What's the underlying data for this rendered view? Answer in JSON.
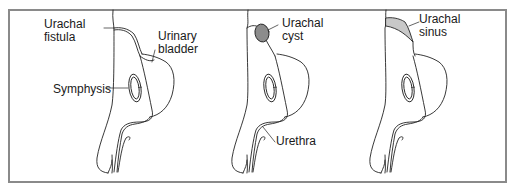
{
  "figure": {
    "panels": [
      {
        "id": "fistula",
        "labels": [
          {
            "text": "Urachal\nfistula",
            "target": "urachal-fistula"
          },
          {
            "text": "Urinary\nbladder",
            "target": "urinary-bladder"
          },
          {
            "text": "Symphysis",
            "target": "symphysis"
          }
        ]
      },
      {
        "id": "cyst",
        "labels": [
          {
            "text": "Urachal\ncyst",
            "target": "urachal-cyst"
          },
          {
            "text": "Urethra",
            "target": "urethra"
          }
        ]
      },
      {
        "id": "sinus",
        "labels": [
          {
            "text": "Urachal\nsinus",
            "target": "urachal-sinus"
          }
        ]
      }
    ],
    "colors": {
      "frame": "#8a8a8a",
      "line": "#222222",
      "cyst_fill": "#8c8c8c",
      "sinus_fill": "#c8c8c8"
    }
  }
}
